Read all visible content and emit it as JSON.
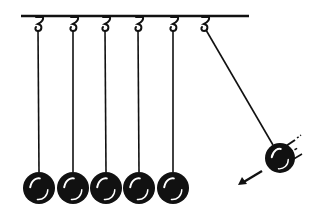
{
  "illustration": {
    "subject": "Newton's cradle",
    "colors": {
      "ink": "#111111",
      "background": "#ffffff",
      "highlight": "#ffffff"
    },
    "bar": {
      "x1": 21,
      "x2": 249,
      "y": 16
    },
    "hanging_balls": [
      {
        "hook_x": 39,
        "cx": 39,
        "cy": 188,
        "r": 16
      },
      {
        "hook_x": 74,
        "cx": 73,
        "cy": 188,
        "r": 16
      },
      {
        "hook_x": 106,
        "cx": 106,
        "cy": 188,
        "r": 16
      },
      {
        "hook_x": 139,
        "cx": 139,
        "cy": 188,
        "r": 16
      },
      {
        "hook_x": 174,
        "cx": 173,
        "cy": 188,
        "r": 16
      }
    ],
    "swinging_ball": {
      "hook_x": 205,
      "cx": 280,
      "cy": 158,
      "r": 15
    },
    "motion_arrow": {
      "direction": "down-left",
      "x1": 262,
      "y1": 171,
      "x2": 238,
      "y2": 185
    }
  }
}
